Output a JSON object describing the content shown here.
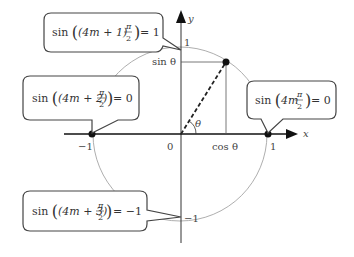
{
  "diagram": {
    "axes": {
      "x_label": "x",
      "y_label": "y",
      "origin_label": "0",
      "x_ticks": {
        "neg_one": "−1",
        "pos_one": "1"
      },
      "y_ticks": {
        "pos_one": "1",
        "neg_one": "−1"
      }
    },
    "angle": {
      "theta_label": "θ",
      "cos_label": "cos θ",
      "sin_label": "sin θ"
    },
    "callouts": [
      {
        "id": "top",
        "prefix": "sin",
        "inner": "(4m + 1)",
        "frac_num": "π",
        "frac_den": "2",
        "result": "= 1",
        "points_to": "(0, 1)"
      },
      {
        "id": "left",
        "prefix": "sin",
        "inner": "(4m + 2)",
        "frac_num": "π",
        "frac_den": "2",
        "result": "= 0",
        "points_to": "(−1, 0)"
      },
      {
        "id": "right",
        "prefix": "sin",
        "inner": "4m",
        "frac_num": "π",
        "frac_den": "2",
        "result": "= 0",
        "points_to": "(1, 0)"
      },
      {
        "id": "bottom",
        "prefix": "sin",
        "inner": "(4m + 3)",
        "frac_num": "π",
        "frac_den": "2",
        "result": "= −1",
        "points_to": "(0, −1)"
      }
    ],
    "colors": {
      "axis": "#111111",
      "circle": "#999999",
      "callout_border": "#444444",
      "text": "#333333"
    }
  }
}
